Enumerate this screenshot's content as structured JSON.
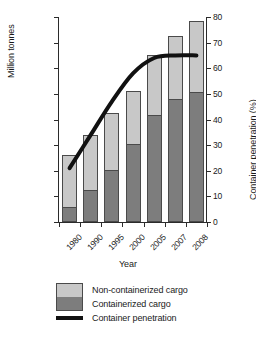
{
  "chart_data": {
    "type": "bar",
    "title": "",
    "subtitle": "",
    "xlabel": "Year",
    "ylabel": "Million tonnes",
    "y2label": "Container penetration (%)",
    "categories": [
      "1980",
      "1990",
      "1995",
      "2000",
      "2005",
      "2007",
      "2008"
    ],
    "ylim": [
      0,
      1600
    ],
    "y2lim": [
      0,
      80
    ],
    "yticks": [
      "0",
      "200",
      "400",
      "600",
      "800",
      "1,000",
      "1,200",
      "1,400",
      "1,600"
    ],
    "ytick_values": [
      0,
      200,
      400,
      600,
      800,
      1000,
      1200,
      1400,
      1600
    ],
    "y2ticks": [
      "0",
      "10",
      "20",
      "30",
      "40",
      "50",
      "60",
      "70",
      "80"
    ],
    "y2tick_values": [
      0,
      10,
      20,
      30,
      40,
      50,
      60,
      70,
      80
    ],
    "grid": false,
    "stacked": true,
    "legend_position": "bottom",
    "series": [
      {
        "name": "Containerized cargo",
        "type": "bar",
        "axis": "left",
        "color": "#7d7d7d",
        "values": [
          110,
          240,
          400,
          600,
          825,
          950,
          1010
        ]
      },
      {
        "name": "Non-containerized cargo",
        "type": "bar",
        "axis": "left",
        "color": "#c8c8c8",
        "values": [
          410,
          440,
          450,
          425,
          475,
          500,
          560
        ]
      },
      {
        "name": "Container penetration",
        "type": "line",
        "axis": "right",
        "color": "#111111",
        "values": [
          21,
          34,
          47,
          58,
          64,
          65,
          65
        ]
      }
    ],
    "totals": [
      520,
      680,
      850,
      1025,
      1300,
      1450,
      1570
    ]
  },
  "legend": {
    "items": [
      {
        "label": "Non-containerized cargo",
        "icon": "legend-swatch-light"
      },
      {
        "label": "Containerized cargo",
        "icon": "legend-swatch-dark"
      },
      {
        "label": "Container penetration",
        "icon": "legend-line-swatch"
      }
    ]
  }
}
